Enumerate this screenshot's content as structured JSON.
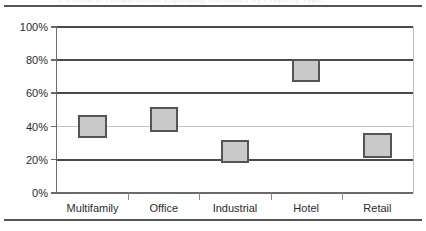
{
  "figure": {
    "clipped_title": "Percent of Respondents Expecting Increases by Property Type",
    "top_rule": "horizontal-rule",
    "bottom_rule": "horizontal-rule"
  },
  "chart_data": {
    "type": "bar",
    "subtype": "floating-range-bar",
    "title": "",
    "xlabel": "",
    "ylabel": "",
    "ylim": [
      0,
      100
    ],
    "ytick_labels": [
      "0%",
      "20%",
      "40%",
      "60%",
      "80%",
      "100%"
    ],
    "ytick_values": [
      0,
      20,
      40,
      60,
      80,
      100
    ],
    "grid": true,
    "grid_axis": "y",
    "legend": "none",
    "categories": [
      "Multifamily",
      "Office",
      "Industrial",
      "Hotel",
      "Retail"
    ],
    "series": [
      {
        "name": "Range low",
        "values": [
          33,
          37,
          18,
          67,
          21
        ]
      },
      {
        "name": "Range high",
        "values": [
          47,
          52,
          32,
          81,
          36
        ]
      }
    ],
    "bars": [
      {
        "category": "Multifamily",
        "low": 33,
        "high": 47
      },
      {
        "category": "Office",
        "low": 37,
        "high": 52
      },
      {
        "category": "Industrial",
        "low": 18,
        "high": 32
      },
      {
        "category": "Hotel",
        "low": 67,
        "high": 81
      },
      {
        "category": "Retail",
        "low": 21,
        "high": 36
      }
    ],
    "colors": {
      "bar_fill": "#c9c9c9",
      "bar_border": "#555555",
      "gridline": "#4a4a4a",
      "gridline_light": "#c4c4c4",
      "axis": "#6b6b6b",
      "text": "#2b2b2b",
      "background": "#ffffff"
    }
  }
}
